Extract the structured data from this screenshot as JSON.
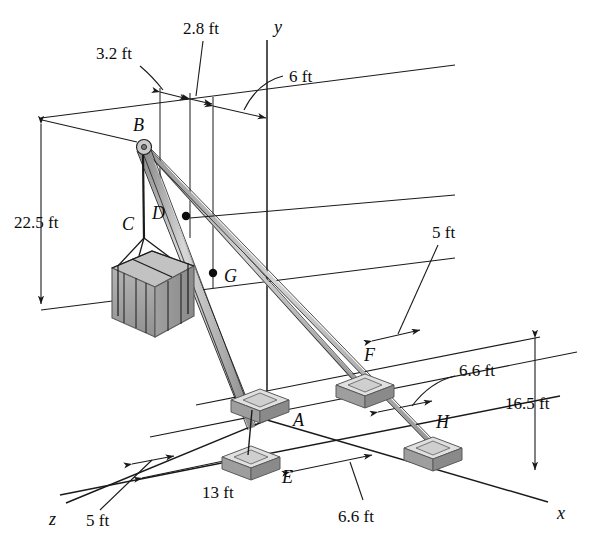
{
  "figure": {
    "type": "engineering-statics-3d-diagram",
    "background_color": "#ffffff",
    "line_color": "#1a1a1a",
    "boom_color": "#b8b8b8",
    "cable_color": "#a8a8a8",
    "pedestal_top_color": "#d8d8d8",
    "pedestal_side_color": "#9a9a9a",
    "crate_color": "#a5a5a5"
  },
  "axes": [
    {
      "name": "y",
      "label": "y",
      "x": 274,
      "y": 27
    },
    {
      "name": "x",
      "label": "x",
      "x": 557,
      "y": 513
    },
    {
      "name": "z",
      "label": "z",
      "x": 53,
      "y": 519
    }
  ],
  "points": [
    {
      "id": "B",
      "label": "B",
      "x": 139,
      "y": 134,
      "role": "boom-tip-pulley"
    },
    {
      "id": "C",
      "label": "C",
      "x": 128,
      "y": 224,
      "role": "crate-sling-cable"
    },
    {
      "id": "D",
      "label": "D",
      "x": 158,
      "y": 214,
      "role": "boom-point"
    },
    {
      "id": "G",
      "label": "G",
      "x": 228,
      "y": 276,
      "role": "boom-point"
    },
    {
      "id": "A",
      "label": "A",
      "x": 297,
      "y": 420,
      "role": "pedestal-base"
    },
    {
      "id": "E",
      "label": "E",
      "x": 286,
      "y": 477,
      "role": "pedestal-base"
    },
    {
      "id": "F",
      "label": "F",
      "x": 370,
      "y": 355,
      "role": "pedestal-base"
    },
    {
      "id": "H",
      "label": "H",
      "x": 440,
      "y": 432,
      "role": "pedestal-base"
    }
  ],
  "dimensions": [
    {
      "id": "dim-3-2",
      "value": "3.2 ft",
      "x": 96,
      "y": 59,
      "axis": "horizontal"
    },
    {
      "id": "dim-2-8",
      "value": "2.8 ft",
      "x": 183,
      "y": 28,
      "axis": "horizontal"
    },
    {
      "id": "dim-6",
      "value": "6 ft",
      "x": 292,
      "y": 82,
      "axis": "horizontal"
    },
    {
      "id": "dim-22-5",
      "value": "22.5 ft",
      "x": 14,
      "y": 222,
      "axis": "vertical"
    },
    {
      "id": "dim-5-right",
      "value": "5 ft",
      "x": 443,
      "y": 230,
      "axis": "depth"
    },
    {
      "id": "dim-6-6-upper",
      "value": "6.6 ft",
      "x": 461,
      "y": 370,
      "axis": "depth"
    },
    {
      "id": "dim-16-5",
      "value": "16.5 ft",
      "x": 537,
      "y": 403,
      "axis": "vertical"
    },
    {
      "id": "dim-13",
      "value": "13 ft",
      "x": 215,
      "y": 492,
      "axis": "horizontal"
    },
    {
      "id": "dim-5-left",
      "value": "5 ft",
      "x": 105,
      "y": 520,
      "axis": "depth"
    },
    {
      "id": "dim-6-6-lower",
      "value": "6.6 ft",
      "x": 352,
      "y": 516,
      "axis": "depth"
    }
  ]
}
